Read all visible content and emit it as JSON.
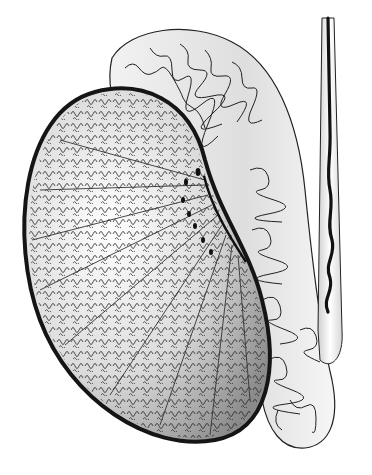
{
  "illustration": {
    "subject": "testis-and-epididymis",
    "background": "#ffffff",
    "colors": {
      "outline": "#1a1a1a",
      "testis_fill_light": "#f4f4f4",
      "testis_fill_dark": "#9a9a9a",
      "epididymis_fill": "#e6e6e6",
      "tubule_stroke": "#222222"
    }
  }
}
